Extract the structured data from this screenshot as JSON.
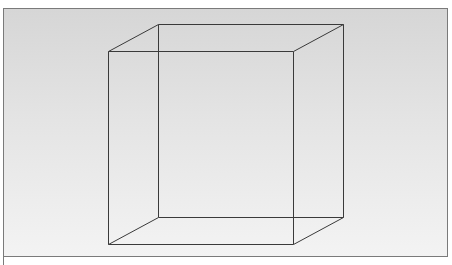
{
  "diagram": {
    "type": "wireframe-cube",
    "colors": {
      "background_top": "#d6d6d6",
      "background_bottom": "#f3f3f3",
      "frame_border": "#7a7a7a",
      "edge_stroke": "#3a3a3a"
    },
    "front_face": [
      [
        108,
        51
      ],
      [
        293,
        51
      ],
      [
        293,
        244
      ],
      [
        108,
        244
      ]
    ],
    "back_face": [
      [
        158,
        24
      ],
      [
        343,
        24
      ],
      [
        343,
        217
      ],
      [
        158,
        217
      ]
    ]
  }
}
